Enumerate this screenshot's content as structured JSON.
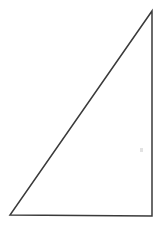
{
  "figure": {
    "kind": "line-drawing",
    "canvas": {
      "width": 163,
      "height": 227,
      "background_color": "#ffffff"
    },
    "stroke": {
      "color": "#3a3a3a",
      "width": 1.5,
      "style": "solid"
    },
    "shape": {
      "name": "right-triangle",
      "closed": true,
      "vertices": [
        {
          "label": "apex",
          "x": 152,
          "y": 11
        },
        {
          "label": "bottom-right",
          "x": 152,
          "y": 216
        },
        {
          "label": "bottom-left",
          "x": 10,
          "y": 215
        }
      ],
      "points_attr": "152,11 152,216 10,215",
      "edges": [
        {
          "name": "hypotenuse",
          "from": "bottom-left",
          "to": "apex"
        },
        {
          "name": "vertical-leg",
          "from": "apex",
          "to": "bottom-right"
        },
        {
          "name": "horizontal-leg",
          "from": "bottom-right",
          "to": "bottom-left"
        }
      ]
    },
    "artifacts": [
      {
        "name": "scan-speck",
        "x": 140,
        "y": 148,
        "width": 3,
        "height": 4,
        "color": "#e2e2e2"
      }
    ],
    "labels": [],
    "text": []
  }
}
